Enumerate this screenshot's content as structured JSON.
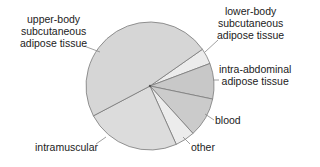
{
  "chart_data": {
    "type": "pie",
    "title": "",
    "start_angle_deg": 55,
    "direction": "clockwise",
    "slices": [
      {
        "label": "lower-body subcutaneous adipose tissue",
        "value": 4,
        "color": "#ececec"
      },
      {
        "label": "intra-abdominal adipose tissue",
        "value": 9,
        "color": "#c8c8c8"
      },
      {
        "label": "blood",
        "value": 10,
        "color": "#cbcbcb"
      },
      {
        "label": "other",
        "value": 5,
        "color": "#ececec"
      },
      {
        "label": "intramuscular",
        "value": 24,
        "color": "#dcdcdc"
      },
      {
        "label": "upper-body subcutaneous adipose tissue",
        "value": 48,
        "color": "#d6d6d6"
      }
    ],
    "legend": "none (direct labels with leader lines)"
  },
  "labels": {
    "upper_body": "upper-body\nsubcutaneous\nadipose tissue",
    "lower_body": "lower-body\nsubcutaneous\nadipose tissue",
    "intra_abdominal": "intra-abdominal\nadipose tissue",
    "blood": "blood",
    "other": "other",
    "intramuscular": "intramuscular"
  },
  "style": {
    "edge_color": "#7a7a7a",
    "leader_color": "#888888"
  }
}
